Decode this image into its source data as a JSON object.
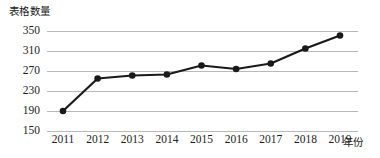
{
  "chart_data": {
    "type": "line",
    "title": "",
    "xlabel": "年份",
    "ylabel": "表格数量",
    "categories": [
      "2011",
      "2012",
      "2013",
      "2014",
      "2015",
      "2016",
      "2017",
      "2018",
      "2019"
    ],
    "values": [
      190,
      255,
      261,
      263,
      281,
      274,
      285,
      315,
      341
    ],
    "series": [
      {
        "name": "表格数量",
        "values": [
          190,
          255,
          261,
          263,
          281,
          274,
          285,
          315,
          341
        ]
      }
    ],
    "ylim": [
      150,
      350
    ],
    "yticks": [
      350,
      310,
      270,
      230,
      190,
      150
    ],
    "ytick_labels": [
      "350",
      "310",
      "270",
      "230",
      "190",
      "150"
    ],
    "xtick_labels": [
      "2011",
      "2012",
      "2013",
      "2014",
      "2015",
      "2016",
      "2017",
      "2018",
      "2019"
    ],
    "grid": "horizontal",
    "legend": "none",
    "marker": "circle",
    "line_color": "#1a1a1a",
    "marker_color": "#1a1a1a",
    "grid_color": "#b9b9b9",
    "background_color": "#ffffff"
  },
  "axes": {
    "y_title": "表格数量",
    "x_title": "年份"
  }
}
